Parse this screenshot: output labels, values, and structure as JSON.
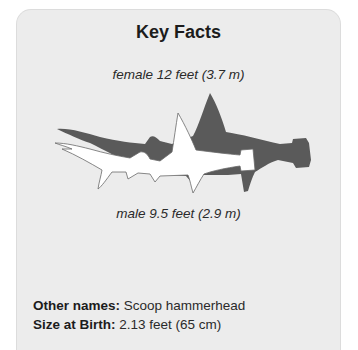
{
  "card": {
    "title": "Key Facts",
    "female_caption": "female 12 feet (3.7 m)",
    "male_caption": "male 9.5 feet (2.9 m)",
    "illustration": {
      "female_shark": {
        "icon": "hammerhead-shark-silhouette-icon",
        "color": "#5a5a5a"
      },
      "male_shark": {
        "icon": "hammerhead-shark-silhouette-icon",
        "color": "#ffffff"
      }
    },
    "facts": [
      {
        "label": "Other names:",
        "value": "Scoop hammerhead"
      },
      {
        "label": "Size at Birth:",
        "value": "2.13 feet (65 cm)"
      }
    ]
  }
}
